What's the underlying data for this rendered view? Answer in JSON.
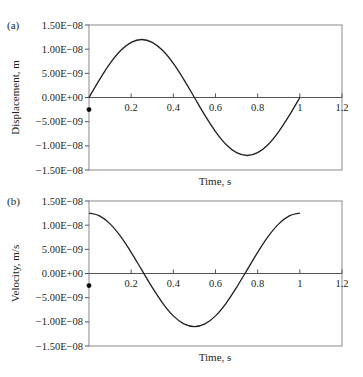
{
  "chart_data": [
    {
      "panel_label": "(a)",
      "type": "line",
      "title": "",
      "xlabel": "Time, s",
      "ylabel": "Displacement, m",
      "xlim": [
        0,
        1.2
      ],
      "ylim": [
        -1.5e-08,
        1.5e-08
      ],
      "x_ticks": [
        "0.2",
        "0.4",
        "0.6",
        "0.8",
        "1",
        "1.2"
      ],
      "y_ticks": [
        "1.50E−08",
        "1.00E−08",
        "5.00E−09",
        "0.00E+00",
        "−5.00E−09",
        "−1.00E−08",
        "−1.50E−08"
      ],
      "grid": false,
      "legend": null,
      "series": [
        {
          "name": "Displacement",
          "x": [
            0,
            0.05,
            0.1,
            0.15,
            0.2,
            0.25,
            0.3,
            0.35,
            0.4,
            0.45,
            0.5,
            0.55,
            0.6,
            0.65,
            0.7,
            0.75,
            0.8,
            0.85,
            0.9,
            0.95,
            1.0
          ],
          "values": [
            0,
            3.71e-09,
            7.05e-09,
            9.71e-09,
            1.141e-08,
            1.2e-08,
            1.141e-08,
            9.71e-09,
            7.05e-09,
            3.71e-09,
            0,
            -3.71e-09,
            -7.05e-09,
            -9.71e-09,
            -1.141e-08,
            -1.2e-08,
            -1.141e-08,
            -9.71e-09,
            -7.05e-09,
            -3.71e-09,
            0
          ]
        }
      ],
      "markers": [
        {
          "x": 0,
          "y": -2.5e-09,
          "style": "dot"
        }
      ]
    },
    {
      "panel_label": "(b)",
      "type": "line",
      "title": "",
      "xlabel": "Time, s",
      "ylabel": "Velocity, m/s",
      "xlim": [
        0,
        1.2
      ],
      "ylim": [
        -1.5e-08,
        1.5e-08
      ],
      "x_ticks": [
        "0.2",
        "0.4",
        "0.6",
        "0.8",
        "1",
        "1.2"
      ],
      "y_ticks": [
        "1.50E−08",
        "1.00E−08",
        "5.00E−09",
        "0.00E+00",
        "−5.00E−09",
        "−1.00E−08",
        "−1.50E−08"
      ],
      "grid": false,
      "legend": null,
      "series": [
        {
          "name": "Velocity",
          "x": [
            0,
            0.05,
            0.1,
            0.15,
            0.2,
            0.25,
            0.3,
            0.35,
            0.4,
            0.45,
            0.5,
            0.55,
            0.6,
            0.65,
            0.7,
            0.75,
            0.8,
            0.85,
            0.9,
            0.95,
            1.0
          ],
          "values": [
            1.25e-08,
            1.193e-08,
            1.026e-08,
            7.66e-09,
            4.38e-09,
            7.5e-10,
            -2.88e-09,
            -6.16e-09,
            -8.76e-09,
            -1.043e-08,
            -1.1e-08,
            -1.043e-08,
            -8.76e-09,
            -6.16e-09,
            -2.88e-09,
            7.5e-10,
            4.38e-09,
            7.66e-09,
            1.026e-08,
            1.193e-08,
            1.25e-08
          ]
        }
      ],
      "markers": [
        {
          "x": 0,
          "y": -2.5e-09,
          "style": "dot"
        }
      ]
    }
  ]
}
